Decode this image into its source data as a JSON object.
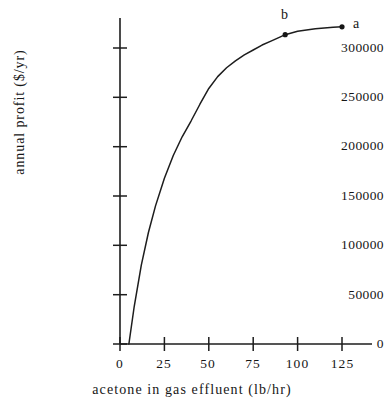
{
  "chart_data": {
    "type": "line",
    "title": "",
    "xlabel": "acetone in gas effluent (lb/hr)",
    "ylabel": "annual profit ($/yr)",
    "xlim": [
      0,
      132
    ],
    "ylim": [
      0,
      330000
    ],
    "grid": false,
    "legend": null,
    "xticks": [
      0,
      25,
      50,
      75,
      100,
      125
    ],
    "xtick_labels": [
      "0",
      "25",
      "50",
      "75",
      "100",
      "125"
    ],
    "yticks": [
      0,
      50000,
      100000,
      150000,
      200000,
      250000,
      300000
    ],
    "ytick_labels": [
      "0",
      "50000",
      "100000",
      "150000",
      "200000",
      "250000",
      "300000"
    ],
    "series": [
      {
        "name": "annual profit",
        "x": [
          5,
          8,
          12,
          16,
          20,
          25,
          30,
          35,
          40,
          45,
          50,
          55,
          60,
          65,
          70,
          75,
          80,
          85,
          90,
          93,
          100,
          110,
          120,
          125
        ],
        "y": [
          0,
          38000,
          80000,
          113000,
          140000,
          168000,
          191000,
          210000,
          226000,
          243000,
          259000,
          271000,
          280000,
          287000,
          293000,
          298000,
          303000,
          307000,
          311000,
          313500,
          317000,
          319500,
          321000,
          321500
        ]
      }
    ],
    "annotations": [
      {
        "label": "b",
        "x": 93,
        "y": 313500,
        "marker": "dot"
      },
      {
        "label": "a",
        "x": 125,
        "y": 321500,
        "marker": "dot"
      }
    ]
  },
  "axes": {
    "y_title": "annual profit ($/yr)",
    "x_title": "acetone in gas effluent (lb/hr)",
    "y_labels": [
      "300000",
      "250000",
      "200000",
      "150000",
      "100000",
      "50000",
      "0"
    ],
    "x_labels": [
      "0",
      "25",
      "50",
      "75",
      "100",
      "125"
    ]
  },
  "points": {
    "a_label": "a",
    "b_label": "b"
  },
  "colors": {
    "ink": "#161616",
    "background": "#ffffff",
    "curve": "#1d1d1d"
  }
}
